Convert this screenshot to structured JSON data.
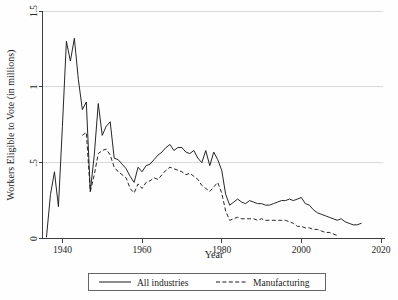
{
  "chart_data": {
    "type": "line",
    "title": "",
    "xlabel": "Year",
    "ylabel": "Workers Eligible to Vote (in millions)",
    "xlim": [
      1935,
      2021
    ],
    "ylim": [
      0,
      1.5
    ],
    "grid": true,
    "grid_axis": "y",
    "legend_position": "below-center",
    "xticks": [
      1940,
      1960,
      1980,
      2000,
      2020
    ],
    "xtick_labels": [
      "1940",
      "1960",
      "1980",
      "2000",
      "2020"
    ],
    "yticks": [
      0,
      0.5,
      1,
      1.5
    ],
    "ytick_labels": [
      "0",
      ".5",
      "1",
      "1.5"
    ],
    "series": [
      {
        "name": "All industries",
        "style": "solid",
        "color": "#1a1a1a",
        "x": [
          1936,
          1937,
          1938,
          1939,
          1940,
          1941,
          1942,
          1943,
          1944,
          1945,
          1946,
          1947,
          1948,
          1949,
          1950,
          1951,
          1952,
          1953,
          1954,
          1955,
          1956,
          1957,
          1958,
          1959,
          1960,
          1961,
          1962,
          1963,
          1964,
          1965,
          1966,
          1967,
          1968,
          1969,
          1970,
          1971,
          1972,
          1973,
          1974,
          1975,
          1976,
          1977,
          1978,
          1979,
          1980,
          1981,
          1982,
          1983,
          1984,
          1985,
          1986,
          1987,
          1988,
          1989,
          1990,
          1991,
          1992,
          1993,
          1994,
          1995,
          1996,
          1997,
          1998,
          1999,
          2000,
          2001,
          2002,
          2003,
          2004,
          2005,
          2006,
          2007,
          2008,
          2009,
          2010,
          2011,
          2012,
          2013,
          2014,
          2015
        ],
        "y": [
          0.01,
          0.29,
          0.44,
          0.21,
          0.74,
          1.3,
          1.17,
          1.32,
          1.05,
          0.85,
          0.9,
          0.31,
          0.55,
          0.89,
          0.68,
          0.74,
          0.77,
          0.53,
          0.52,
          0.49,
          0.46,
          0.41,
          0.37,
          0.47,
          0.44,
          0.48,
          0.49,
          0.52,
          0.55,
          0.57,
          0.6,
          0.62,
          0.58,
          0.6,
          0.6,
          0.57,
          0.56,
          0.58,
          0.53,
          0.5,
          0.58,
          0.48,
          0.57,
          0.52,
          0.45,
          0.29,
          0.22,
          0.24,
          0.26,
          0.24,
          0.23,
          0.25,
          0.24,
          0.23,
          0.23,
          0.22,
          0.22,
          0.23,
          0.24,
          0.25,
          0.25,
          0.26,
          0.25,
          0.26,
          0.27,
          0.23,
          0.22,
          0.19,
          0.17,
          0.16,
          0.15,
          0.14,
          0.13,
          0.12,
          0.13,
          0.11,
          0.1,
          0.09,
          0.09,
          0.1
        ]
      },
      {
        "name": "Manufacturing",
        "style": "dashed",
        "color": "#1a1a1a",
        "x": [
          1945,
          1946,
          1947,
          1948,
          1949,
          1950,
          1951,
          1952,
          1953,
          1954,
          1955,
          1956,
          1957,
          1958,
          1959,
          1960,
          1961,
          1962,
          1963,
          1964,
          1965,
          1966,
          1967,
          1968,
          1969,
          1970,
          1971,
          1972,
          1973,
          1974,
          1975,
          1976,
          1977,
          1978,
          1979,
          1980,
          1981,
          1982,
          1983,
          1984,
          1985,
          1986,
          1987,
          1988,
          1989,
          1990,
          1991,
          1992,
          1993,
          1994,
          1995,
          1996,
          1997,
          1998,
          1999,
          2000,
          2001,
          2002,
          2003,
          2004,
          2005,
          2006,
          2007,
          2008,
          2009
        ],
        "y": [
          0.68,
          0.7,
          0.31,
          0.42,
          0.56,
          0.58,
          0.59,
          0.55,
          0.47,
          0.44,
          0.42,
          0.4,
          0.33,
          0.3,
          0.36,
          0.33,
          0.37,
          0.38,
          0.4,
          0.39,
          0.42,
          0.45,
          0.47,
          0.46,
          0.45,
          0.44,
          0.42,
          0.43,
          0.41,
          0.39,
          0.35,
          0.33,
          0.31,
          0.34,
          0.37,
          0.3,
          0.18,
          0.12,
          0.13,
          0.14,
          0.13,
          0.13,
          0.13,
          0.13,
          0.12,
          0.13,
          0.12,
          0.12,
          0.12,
          0.12,
          0.12,
          0.12,
          0.11,
          0.1,
          0.08,
          0.08,
          0.07,
          0.07,
          0.06,
          0.06,
          0.05,
          0.04,
          0.04,
          0.03,
          0.02
        ]
      }
    ]
  },
  "legend": {
    "entries": [
      {
        "label": "All industries",
        "style": "solid"
      },
      {
        "label": "Manufacturing",
        "style": "dashed"
      }
    ]
  },
  "colors": {
    "line": "#1a1a1a",
    "grid": "#d9d9d9",
    "axis": "#2b2b2b",
    "background": "#fefefe",
    "legend_border": "#555555"
  }
}
